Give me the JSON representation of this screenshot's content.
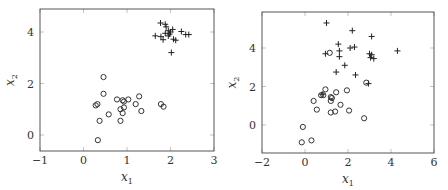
{
  "chart_data": [
    {
      "type": "scatter",
      "title": "",
      "xlabel": "x1",
      "ylabel": "x2",
      "xlim": [
        -1,
        3
      ],
      "ylim": [
        -0.6,
        4.9
      ],
      "xticks": [
        -1,
        0,
        1,
        2,
        3
      ],
      "yticks": [
        0,
        2,
        4
      ],
      "grid": false,
      "legend": null,
      "series": [
        {
          "name": "class-circle",
          "marker": "o",
          "points": [
            [
              0.46,
              2.25
            ],
            [
              0.46,
              1.6
            ],
            [
              0.28,
              1.15
            ],
            [
              0.32,
              1.2
            ],
            [
              0.77,
              1.38
            ],
            [
              0.9,
              1.35
            ],
            [
              0.93,
              1.3
            ],
            [
              1.03,
              1.38
            ],
            [
              1.28,
              1.5
            ],
            [
              1.2,
              1.2
            ],
            [
              0.85,
              1.0
            ],
            [
              0.93,
              1.07
            ],
            [
              0.9,
              0.85
            ],
            [
              1.33,
              0.93
            ],
            [
              0.58,
              0.8
            ],
            [
              0.37,
              0.55
            ],
            [
              0.85,
              0.55
            ],
            [
              0.33,
              -0.2
            ],
            [
              1.78,
              1.2
            ],
            [
              1.84,
              1.1
            ]
          ]
        },
        {
          "name": "class-plus",
          "marker": "+",
          "points": [
            [
              1.77,
              4.35
            ],
            [
              1.88,
              4.3
            ],
            [
              1.9,
              4.2
            ],
            [
              1.65,
              3.85
            ],
            [
              1.78,
              3.82
            ],
            [
              1.83,
              3.7
            ],
            [
              1.88,
              3.95
            ],
            [
              1.95,
              4.05
            ],
            [
              2.0,
              4.0
            ],
            [
              2.05,
              4.1
            ],
            [
              1.98,
              3.92
            ],
            [
              2.07,
              3.72
            ],
            [
              2.12,
              3.68
            ],
            [
              2.25,
              4.02
            ],
            [
              2.35,
              3.9
            ],
            [
              2.42,
              3.9
            ],
            [
              2.02,
              3.2
            ],
            [
              1.95,
              3.85
            ]
          ]
        }
      ]
    },
    {
      "type": "scatter",
      "title": "",
      "xlabel": "x1",
      "ylabel": "x2",
      "xlim": [
        -2,
        6
      ],
      "ylim": [
        -1.4,
        5.9
      ],
      "xticks": [
        -2,
        0,
        2,
        4,
        6
      ],
      "yticks": [
        0,
        2,
        4
      ],
      "grid": false,
      "legend": null,
      "series": [
        {
          "name": "class-circle",
          "marker": "o",
          "points": [
            [
              1.15,
              3.75
            ],
            [
              2.85,
              2.2
            ],
            [
              0.95,
              1.85
            ],
            [
              1.95,
              1.8
            ],
            [
              1.45,
              1.7
            ],
            [
              0.75,
              1.55
            ],
            [
              0.85,
              1.55
            ],
            [
              1.2,
              1.45
            ],
            [
              1.25,
              1.4
            ],
            [
              1.2,
              1.25
            ],
            [
              0.4,
              1.25
            ],
            [
              1.65,
              1.05
            ],
            [
              0.55,
              0.8
            ],
            [
              1.4,
              0.7
            ],
            [
              1.2,
              0.65
            ],
            [
              2.05,
              0.75
            ],
            [
              2.75,
              0.35
            ],
            [
              -0.1,
              -0.1
            ],
            [
              -0.15,
              -0.9
            ],
            [
              0.3,
              -0.8
            ]
          ]
        },
        {
          "name": "class-plus",
          "marker": "+",
          "points": [
            [
              1.0,
              5.3
            ],
            [
              2.2,
              4.9
            ],
            [
              3.1,
              4.6
            ],
            [
              1.55,
              4.2
            ],
            [
              1.6,
              3.85
            ],
            [
              1.6,
              3.55
            ],
            [
              2.1,
              4.0
            ],
            [
              2.3,
              4.05
            ],
            [
              0.95,
              3.7
            ],
            [
              3.0,
              3.7
            ],
            [
              3.1,
              3.65
            ],
            [
              3.05,
              3.5
            ],
            [
              3.2,
              3.45
            ],
            [
              4.3,
              3.85
            ],
            [
              1.85,
              3.1
            ],
            [
              1.45,
              2.75
            ],
            [
              2.35,
              2.6
            ],
            [
              2.95,
              2.15
            ],
            [
              0.8,
              1.6
            ]
          ]
        }
      ]
    }
  ],
  "plots": [
    {
      "xlabel_main": "x",
      "xlabel_sub": "1",
      "ylabel_main": "x",
      "ylabel_sub": "2",
      "xtick_labels": [
        "−1",
        "0",
        "1",
        "2",
        "3"
      ],
      "ytick_labels": [
        "0",
        "2",
        "4"
      ]
    },
    {
      "xlabel_main": "x",
      "xlabel_sub": "1",
      "ylabel_main": "x",
      "ylabel_sub": "2",
      "xtick_labels": [
        "−2",
        "0",
        "2",
        "4",
        "6"
      ],
      "ytick_labels": [
        "0",
        "2",
        "4"
      ]
    }
  ]
}
